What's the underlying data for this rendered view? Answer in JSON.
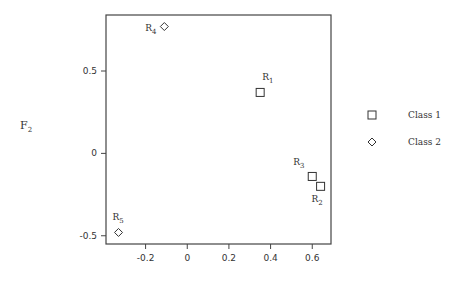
{
  "chart_data": {
    "type": "scatter",
    "title": "",
    "xlabel": "",
    "ylabel": "F2",
    "xlim": [
      -0.39,
      0.69
    ],
    "ylim": [
      -0.55,
      0.84
    ],
    "xticks": [
      -0.2,
      0,
      0.2,
      0.4,
      0.6
    ],
    "xtick_labels": [
      "-0.2",
      "0",
      "0.2",
      "0.4",
      "0.6"
    ],
    "yticks": [
      -0.5,
      0,
      0.5
    ],
    "ytick_labels": [
      "-0.5",
      "0",
      "0.5"
    ],
    "grid": false,
    "legend_position": "right",
    "series": [
      {
        "name": "Class 1",
        "marker": "square",
        "points": [
          {
            "label": "R1",
            "x": 0.35,
            "y": 0.37
          },
          {
            "label": "R2",
            "x": 0.64,
            "y": -0.2
          },
          {
            "label": "R3",
            "x": 0.6,
            "y": -0.14
          }
        ]
      },
      {
        "name": "Class 2",
        "marker": "diamond",
        "points": [
          {
            "label": "R4",
            "x": -0.11,
            "y": 0.77
          },
          {
            "label": "R5",
            "x": -0.33,
            "y": -0.48
          }
        ]
      }
    ]
  },
  "labels": {
    "ylabel_main": "F",
    "ylabel_sub": "2",
    "legend": [
      "Class 1",
      "Class 2"
    ]
  }
}
